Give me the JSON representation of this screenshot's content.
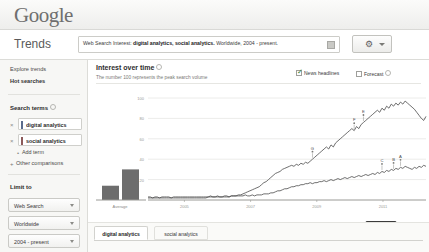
{
  "brand": {
    "logo_text": "Google"
  },
  "header": {
    "product_title": "Trends",
    "query_prefix": "Web Search Interest:",
    "query_terms": "digital analytics, social analytics.",
    "query_scope": "Worldwide, 2004 - present.",
    "embed_icon": "embed-icon",
    "gear_icon": "gear-icon",
    "caret_icon": "chevron-down-icon"
  },
  "sidebar": {
    "links": [
      {
        "label": "Explore trends",
        "bold": false
      },
      {
        "label": "Hot searches",
        "bold": true
      }
    ],
    "search_terms_heading": "Search terms",
    "terms": [
      {
        "label": "digital analytics",
        "color": "#5a6b8c",
        "remove_icon": "close-icon"
      },
      {
        "label": "social analytics",
        "color": "#8c5a5a",
        "remove_icon": "close-icon"
      }
    ],
    "add_term_label": "Add term",
    "other_comparisons_label": "Other comparisons",
    "limit_to_heading": "Limit to",
    "filters": [
      {
        "label": "Web Search",
        "caret": "chevron-down-icon"
      },
      {
        "label": "Worldwide",
        "caret": "chevron-down-icon"
      },
      {
        "label": "2004 - present",
        "caret": "chevron-down-icon"
      }
    ]
  },
  "main": {
    "section_title": "Interest over time",
    "section_subtitle": "The number 100 represents the peak search volume",
    "info_icon": "info-icon",
    "checkboxes": [
      {
        "label": "News headlines",
        "checked": true
      },
      {
        "label": "Forecast",
        "checked": false
      }
    ],
    "embed_button": "Embed",
    "tabs": [
      {
        "label": "digital analytics",
        "active": true
      },
      {
        "label": "social analytics",
        "active": false
      }
    ]
  },
  "chart_data": {
    "type": "line",
    "title": "Interest over time",
    "xlabel": "",
    "ylabel": "",
    "ylim": [
      0,
      100
    ],
    "yticks": [
      100,
      80,
      60,
      40,
      20
    ],
    "xticks": [
      "2005",
      "2007",
      "2009",
      "2011"
    ],
    "grid": true,
    "legend_position": "none",
    "average_bars": {
      "label": "Average",
      "categories": [
        "digital analytics",
        "social analytics"
      ],
      "values": [
        14,
        30
      ]
    },
    "annotations": [
      {
        "letter": "G",
        "series": "social analytics",
        "x": 0.595
      },
      {
        "letter": "F",
        "series": "social analytics",
        "x": 0.745
      },
      {
        "letter": "E",
        "series": "social analytics",
        "x": 0.775
      },
      {
        "letter": "C",
        "series": "digital analytics",
        "x": 0.845
      },
      {
        "letter": "B",
        "series": "digital analytics",
        "x": 0.885
      },
      {
        "letter": "A",
        "series": "digital analytics",
        "x": 0.905
      }
    ],
    "series": [
      {
        "name": "digital analytics",
        "color": "#4a4a4a",
        "values": [
          3,
          3,
          2,
          3,
          3,
          2,
          3,
          3,
          3,
          3,
          2,
          3,
          3,
          3,
          3,
          3,
          3,
          3,
          3,
          3,
          3,
          3,
          3,
          3,
          3,
          3,
          3,
          4,
          3,
          3,
          4,
          3,
          3,
          4,
          4,
          3,
          4,
          4,
          4,
          4,
          4,
          4,
          5,
          4,
          4,
          5,
          4,
          5,
          5,
          5,
          6,
          6,
          6,
          7,
          7,
          8,
          9,
          9,
          10,
          11,
          11,
          12,
          13,
          13,
          14,
          14,
          15,
          15,
          16,
          16,
          17,
          16,
          17,
          17,
          18,
          18,
          19,
          18,
          19,
          20,
          19,
          20,
          21,
          20,
          21,
          22,
          21,
          22,
          23,
          22,
          23,
          24,
          23,
          24,
          25,
          24,
          25,
          26,
          25,
          27,
          26,
          28,
          27,
          29,
          28,
          30,
          29,
          31,
          30,
          32,
          31,
          33,
          32,
          31,
          30,
          32,
          31,
          33,
          32,
          34,
          33
        ]
      },
      {
        "name": "social analytics",
        "color": "#4a4a4a",
        "values": [
          2,
          2,
          2,
          2,
          2,
          2,
          2,
          2,
          2,
          2,
          2,
          2,
          2,
          2,
          2,
          2,
          2,
          2,
          2,
          2,
          2,
          2,
          2,
          2,
          2,
          2,
          3,
          3,
          3,
          3,
          3,
          3,
          3,
          3,
          3,
          3,
          4,
          4,
          4,
          5,
          5,
          6,
          7,
          8,
          9,
          10,
          11,
          12,
          13,
          15,
          17,
          18,
          20,
          22,
          24,
          26,
          27,
          28,
          30,
          31,
          32,
          33,
          34,
          33,
          35,
          34,
          36,
          35,
          37,
          36,
          38,
          40,
          42,
          44,
          46,
          48,
          50,
          52,
          50,
          54,
          52,
          56,
          58,
          60,
          62,
          64,
          66,
          68,
          70,
          68,
          72,
          70,
          74,
          76,
          78,
          80,
          82,
          84,
          86,
          88,
          86,
          90,
          88,
          92,
          90,
          94,
          92,
          95,
          93,
          96,
          94,
          97,
          95,
          93,
          91,
          89,
          86,
          83,
          80,
          78,
          82
        ]
      }
    ]
  }
}
